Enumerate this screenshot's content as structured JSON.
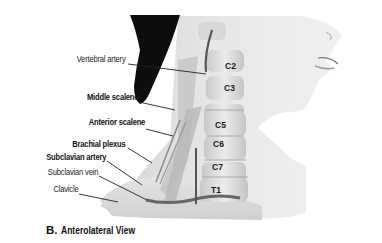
{
  "figure": {
    "caption_letter": "B.",
    "caption_text": "Anterolateral View",
    "labels": [
      {
        "id": "vertebral-artery",
        "text": "Vertebral artery",
        "bold": false
      },
      {
        "id": "middle-scalene",
        "text": "Middle scalene",
        "bold": true
      },
      {
        "id": "anterior-scalene",
        "text": "Anterior scalene",
        "bold": true
      },
      {
        "id": "brachial-plexus",
        "text": "Brachial plexus",
        "bold": true
      },
      {
        "id": "subclavian-artery",
        "text": "Subclavian artery",
        "bold": true
      },
      {
        "id": "subclavian-vein",
        "text": "Subclavian vein",
        "bold": false
      },
      {
        "id": "clavicle",
        "text": "Clavicle",
        "bold": false
      }
    ],
    "vertebrae": [
      "C2",
      "C3",
      "C5",
      "C6",
      "C7",
      "T1"
    ],
    "colors": {
      "background": "#ffffff",
      "skin_light": "#e6e6e6",
      "skin_mid": "#c9c9c9",
      "hair": "#111111",
      "bone": "#d9d9d9",
      "leader_line": "#222222"
    }
  }
}
